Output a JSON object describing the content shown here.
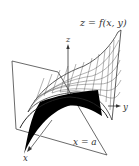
{
  "figure": {
    "surface_label": "z = f(x, y)",
    "plane_label": "x = a",
    "axes": {
      "x": "x",
      "y": "y",
      "z": "z"
    },
    "colors": {
      "line": "#333333",
      "trace_fill": "#000000",
      "background": "#ffffff"
    }
  }
}
